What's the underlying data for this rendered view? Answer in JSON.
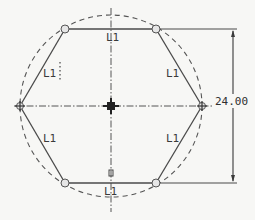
{
  "drawing": {
    "title": "Hexagon sketch inscribed in construction circle",
    "colors": {
      "background": "#f7f7f5",
      "geometry": "#4a4a4a",
      "construction": "#555555",
      "dimension": "#3a3a3a"
    },
    "dimension": {
      "value": "24.00",
      "orientation": "vertical"
    },
    "constraint_labels": {
      "top": "L1",
      "upper_left": "L1",
      "upper_right": "L1",
      "lower_left": "L1",
      "lower_right": "L1",
      "bottom": "L1"
    },
    "markers": {
      "center": "origin-point",
      "vertices": [
        "top-left",
        "top-right",
        "right",
        "bottom-right",
        "bottom-left",
        "left"
      ]
    }
  }
}
